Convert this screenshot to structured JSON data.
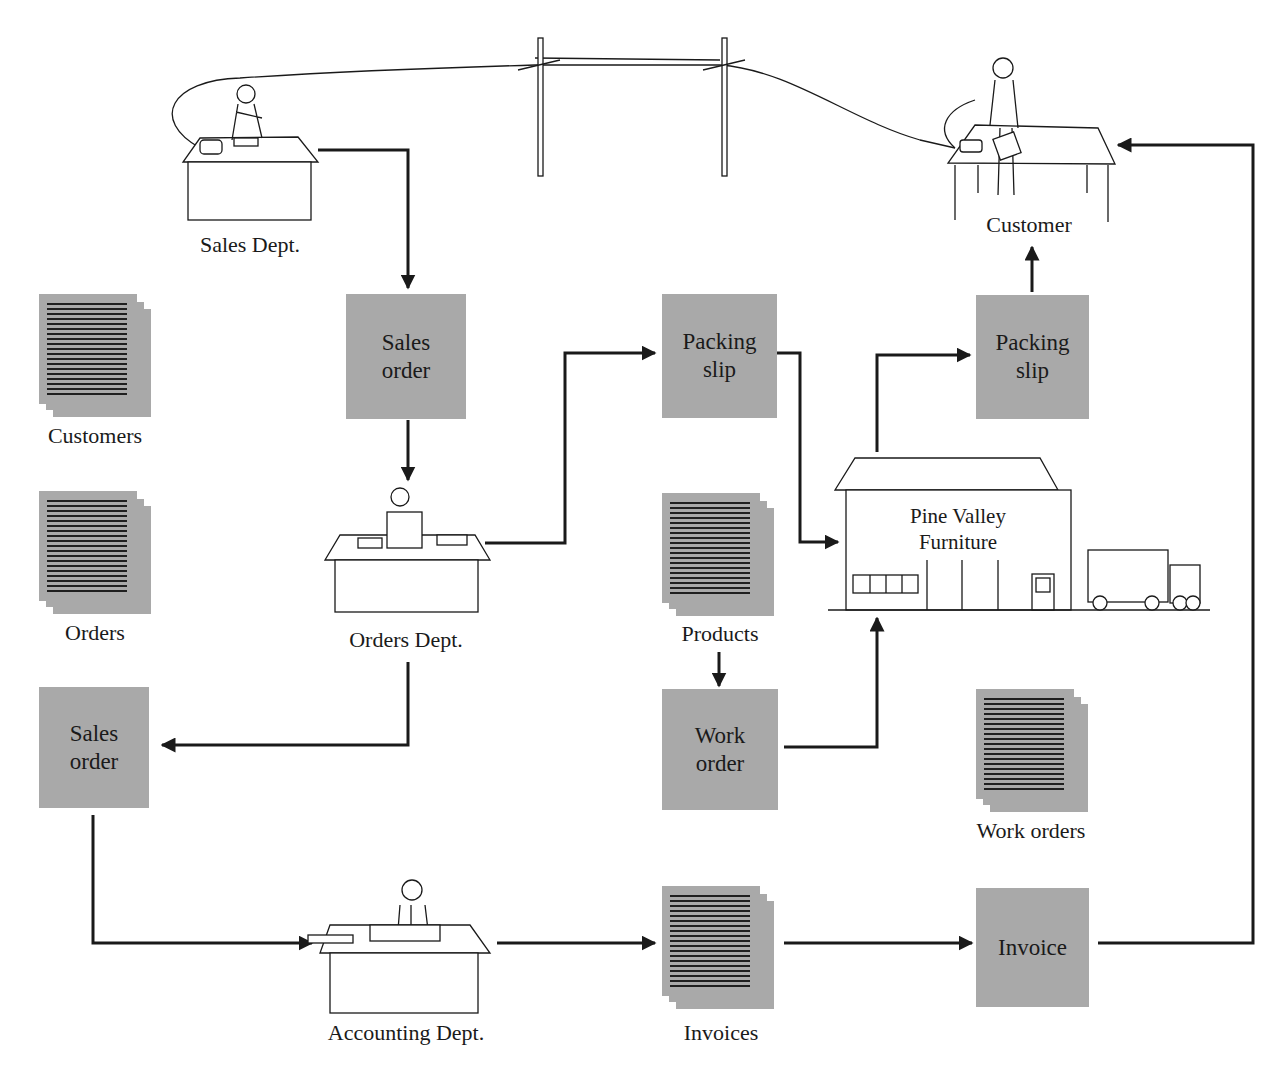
{
  "diagram": {
    "type": "information-flow",
    "actors": {
      "sales_dept": "Sales Dept.",
      "customer": "Customer",
      "orders_dept": "Orders Dept.",
      "accounting_dept": "Accounting Dept.",
      "factory": "Pine Valley\nFurniture"
    },
    "documents": {
      "sales_order_top": "Sales\norder",
      "sales_order_left": "Sales\norder",
      "packing_slip_mid": "Packing\nslip",
      "packing_slip_right": "Packing\nslip",
      "work_order": "Work\norder",
      "invoice": "Invoice"
    },
    "files": {
      "customers": "Customers",
      "orders": "Orders",
      "products": "Products",
      "work_orders": "Work orders",
      "invoices": "Invoices"
    },
    "flows": [
      {
        "from": "Sales Dept.",
        "to": "Sales order"
      },
      {
        "from": "Sales order",
        "to": "Orders Dept."
      },
      {
        "from": "Orders Dept.",
        "to": "Packing slip"
      },
      {
        "from": "Orders Dept.",
        "to": "Sales order (left)"
      },
      {
        "from": "Packing slip",
        "to": "Pine Valley Furniture"
      },
      {
        "from": "Pine Valley Furniture",
        "to": "Packing slip (right)"
      },
      {
        "from": "Packing slip (right)",
        "to": "Customer"
      },
      {
        "from": "Products",
        "to": "Work order"
      },
      {
        "from": "Work order",
        "to": "Pine Valley Furniture"
      },
      {
        "from": "Sales order (left)",
        "to": "Accounting Dept."
      },
      {
        "from": "Accounting Dept.",
        "to": "Invoices"
      },
      {
        "from": "Invoices",
        "to": "Invoice"
      },
      {
        "from": "Invoice",
        "to": "Customer"
      },
      {
        "from": "Sales Dept.",
        "to": "Customer",
        "kind": "telephone-line"
      }
    ],
    "colors": {
      "doc_fill": "#a9a9a9",
      "line": "#1a1a1a"
    }
  }
}
